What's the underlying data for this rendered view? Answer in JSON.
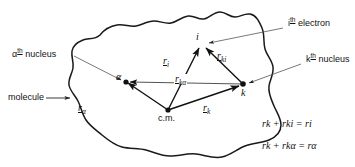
{
  "figure": {
    "colors": {
      "ink": "#111111",
      "outline": "#1a1a1a",
      "pointer": "#555555",
      "background": "#ffffff"
    },
    "callouts": {
      "alpha_nucleus": "α",
      "alpha_nucleus_sup": "th",
      "alpha_nucleus_rest": " nucleus",
      "molecule": "molecule",
      "i_electron": "i",
      "i_electron_sup": "th",
      "i_electron_rest": " electron",
      "k_nucleus": "k",
      "k_nucleus_sup": "th",
      "k_nucleus_rest": " nucleus"
    },
    "points": {
      "alpha": "α",
      "i": "i",
      "k": "k",
      "cm": "c.m."
    },
    "vectors": {
      "r_i": {
        "base": "r",
        "sub": "i"
      },
      "r_alpha": {
        "base": "r",
        "sub": "α"
      },
      "r_k": {
        "base": "r",
        "sub": "k"
      },
      "r_ki": {
        "base": "r",
        "sub": "ki"
      },
      "r_kalpha": {
        "base": "r",
        "sub": "kα"
      }
    },
    "equations": [
      "ṟk + ṟki = ṟi",
      "ṟk + ṟkα = ṟα"
    ],
    "equation_parts": [
      {
        "t1": "r",
        "s1": "k",
        "op": "+",
        "t2": "r",
        "s2": "ki",
        "eq": "=",
        "t3": "r",
        "s3": "i"
      },
      {
        "t1": "r",
        "s1": "k",
        "op": "+",
        "t2": "r",
        "s2": "kα",
        "eq": "=",
        "t3": "r",
        "s3": "α"
      }
    ]
  }
}
